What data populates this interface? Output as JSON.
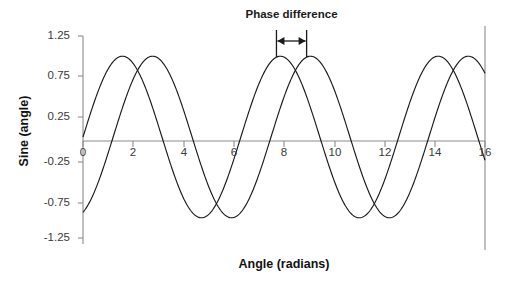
{
  "chart_data": {
    "type": "line",
    "title": "",
    "xlabel": "Angle (radians)",
    "ylabel": "Sine (angle)",
    "xlim": [
      0,
      16
    ],
    "ylim": [
      -1.25,
      1.25
    ],
    "xticks": [
      0,
      2,
      4,
      6,
      8,
      10,
      12,
      14,
      16
    ],
    "xtick_labels": [
      "0",
      "2",
      "4",
      "6",
      "8",
      "10",
      "12",
      "14",
      "16"
    ],
    "yticks": [
      1.25,
      0.75,
      0.25,
      -0.25,
      -0.75,
      -1.25
    ],
    "ytick_labels": [
      "1.25",
      "0.75",
      "0.25",
      "-0.25",
      "-0.75",
      "-1.25"
    ],
    "grid": false,
    "legend": "none",
    "line_color": "#1a1a1a",
    "axis_color": "#8c8c8c",
    "series": [
      {
        "name": "wave-1",
        "formula": "sin(x)",
        "amplitude": 1.0,
        "phase_radians": 0.0,
        "y_at_x0": 0.0,
        "first_peak_x": 1.57,
        "peak_value": 1.0,
        "trough_value": -1.0
      },
      {
        "name": "wave-2",
        "formula": "sin(x - 1.2)",
        "amplitude": 1.0,
        "phase_radians": 1.2,
        "y_at_x0": -0.93,
        "first_peak_x": 2.77,
        "peak_value": 1.0,
        "trough_value": -1.0
      }
    ],
    "annotations": [
      {
        "name": "phase-difference",
        "text": "Phase difference",
        "type": "double-arrow",
        "x_start": 7.7,
        "x_end": 8.9,
        "value_radians": 1.2
      }
    ]
  },
  "axes": {
    "y_title": "Sine (angle)",
    "x_title": "Angle (radians)"
  },
  "annotation": {
    "phase_difference_label": "Phase difference"
  },
  "ticks": {
    "y": [
      "1.25",
      "0.75",
      "0.25",
      "-0.25",
      "-0.75",
      "-1.25"
    ],
    "x": [
      "0",
      "2",
      "4",
      "6",
      "8",
      "10",
      "12",
      "14",
      "16"
    ]
  }
}
